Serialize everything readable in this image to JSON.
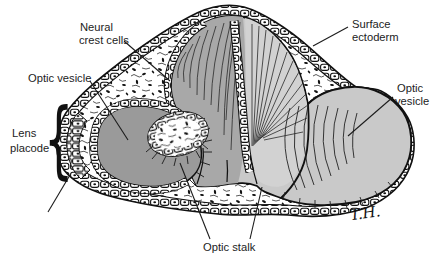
{
  "figure": {
    "labels": {
      "neural_crest": {
        "line1": "Neural",
        "line2": "crest cells"
      },
      "surface_ectoderm": {
        "line1": "Surface",
        "line2": "ectoderm"
      },
      "optic_vesicle_left": {
        "text": "Optic vesicle"
      },
      "optic_vesicle_right": {
        "line1": "Optic",
        "line2": "vesicle"
      },
      "lens_placode": {
        "line1": "Lens",
        "line2": "placode",
        "brace": "{"
      },
      "optic_stalk": {
        "text": "Optic stalk"
      }
    },
    "signature": {
      "text": "T.H."
    },
    "colors": {
      "background": "#ffffff",
      "ink": "#111111",
      "left_vesicle_lumen": "#9a9a9a",
      "dome_left": "#a8a8a8",
      "dome_right": "#d2d2d2",
      "right_vesicle": "#c9c9c9"
    }
  }
}
